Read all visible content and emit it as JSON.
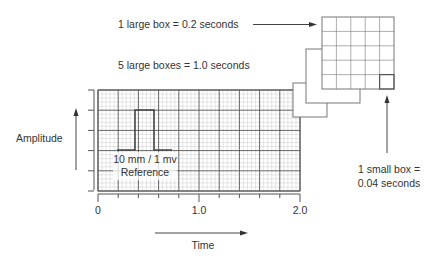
{
  "labels": {
    "large_box": "1 large box = 0.2 seconds",
    "five_boxes": "5 large boxes = 1.0 seconds",
    "amplitude": "Amplitude",
    "reference_line1": "10 mm / 1 mv",
    "reference_line2": "Reference",
    "small_box_line1": "1 small box =",
    "small_box_line2": "0.04 seconds",
    "time": "Time"
  },
  "x_axis": {
    "ticks": [
      "0",
      "1.0",
      "2.0"
    ],
    "range": [
      0,
      2.0
    ],
    "minor_step": 0.2
  },
  "grid": {
    "large_boxes_x": 10,
    "large_boxes_y": 5,
    "small_per_large": 5
  },
  "zoom_box": {
    "large_boxes": 5,
    "highlighted": "bottom-right small box"
  },
  "colors": {
    "ink": "#333333",
    "major_grid": "#555555",
    "minor_grid": "#cccccc",
    "box_stroke": "#777777"
  }
}
